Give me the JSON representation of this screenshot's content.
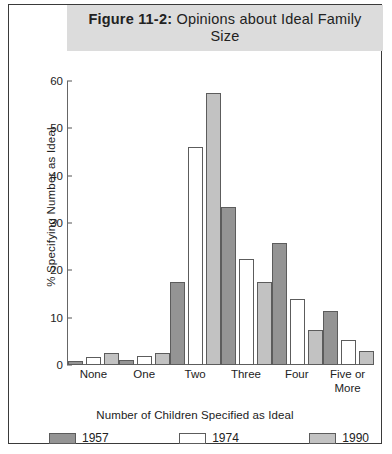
{
  "figure": {
    "title_prefix": "Figure 11-2:",
    "title_rest": " Opinions about Ideal Family Size",
    "frame_border_color": "#3a3a3a",
    "title_band_color": "#dcdcdc"
  },
  "legend": {
    "position": "bottom",
    "entries": [
      {
        "label": "1957",
        "color": "#949494",
        "icon": "legend-swatch-icon"
      },
      {
        "label": "1974",
        "color": "#ffffff",
        "icon": "legend-swatch-icon"
      },
      {
        "label": "1990",
        "color": "#c2c2c2",
        "icon": "legend-swatch-icon"
      }
    ]
  },
  "chart_data": {
    "type": "bar",
    "title": "Figure 11-2: Opinions about Ideal Family Size",
    "xlabel": "Number of Children Specified as Ideal",
    "ylabel": "% Specifying Number as Ideal",
    "categories": [
      "None",
      "One",
      "Two",
      "Three",
      "Four",
      "Five or More"
    ],
    "category_lines": [
      [
        "None"
      ],
      [
        "One"
      ],
      [
        "Two"
      ],
      [
        "Three"
      ],
      [
        "Four"
      ],
      [
        "Five or",
        "More"
      ]
    ],
    "series": [
      {
        "name": "1957",
        "color": "#949494",
        "values": [
          0.8,
          1.0,
          17.6,
          33.3,
          25.7,
          11.5
        ]
      },
      {
        "name": "1974",
        "color": "#ffffff",
        "values": [
          1.6,
          2.0,
          46.0,
          22.3,
          14.0,
          5.3
        ]
      },
      {
        "name": "1990",
        "color": "#c2c2c2",
        "values": [
          2.6,
          2.5,
          57.4,
          17.6,
          7.5,
          3.0
        ]
      }
    ],
    "ylim": [
      0,
      60
    ],
    "yticks": [
      0,
      10,
      20,
      30,
      40,
      50,
      60
    ],
    "ytick_labels": [
      "0",
      "10",
      "20",
      "30",
      "40",
      "50",
      "60"
    ],
    "grid": false,
    "legend_position": "bottom"
  }
}
